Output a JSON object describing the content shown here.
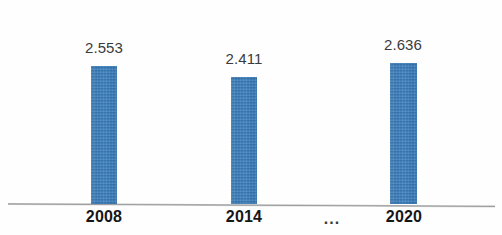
{
  "chart_data": {
    "type": "bar",
    "title": "",
    "subtitle": "",
    "xlabel": "",
    "ylabel": "",
    "categories": [
      "2008",
      "2014",
      "2020"
    ],
    "values": [
      2.553,
      2.411,
      2.636
    ],
    "value_labels": [
      "2.553",
      "2.411",
      "2.636"
    ],
    "series": [
      {
        "name": "",
        "values": [
          2.553,
          2.411,
          2.636
        ]
      }
    ],
    "gap_marker": "...",
    "gap_marker_meaning": "omitted years between 2014 and 2020",
    "ylim": [
      0,
      2.9
    ],
    "grid": false,
    "legend": false,
    "legend_position": "none",
    "axis_line": true,
    "bar_color": "#3d80bb",
    "value_label_color": "#3b3b3d",
    "category_label_color": "#161618",
    "background_color": "#fefefe"
  },
  "bars": [
    {
      "category": "2008",
      "value_label": "2.553"
    },
    {
      "category": "2014",
      "value_label": "2.411"
    },
    {
      "category": "2020",
      "value_label": "2.636"
    }
  ],
  "axis": {
    "gap_marker": "..."
  }
}
